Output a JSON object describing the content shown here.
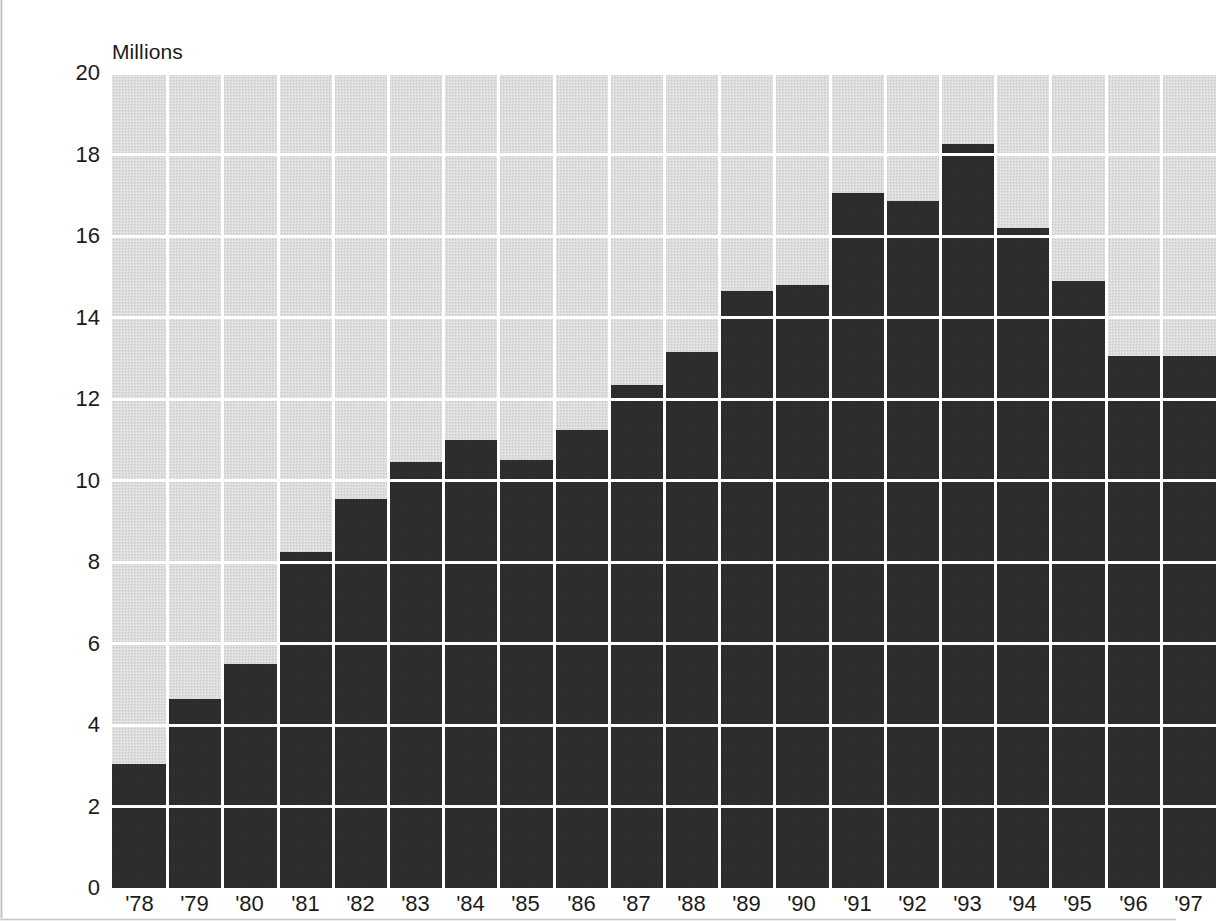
{
  "chart_data": {
    "type": "bar",
    "title": "",
    "subtitle": "",
    "units_label": "Millions",
    "xlabel": "",
    "ylabel": "Millions",
    "ylim": [
      0,
      20
    ],
    "ytick_values": [
      0,
      2,
      4,
      6,
      8,
      10,
      12,
      14,
      16,
      18,
      20
    ],
    "ytick_labels": [
      "0",
      "2",
      "4",
      "6",
      "8",
      "10",
      "12",
      "14",
      "16",
      "18",
      "20"
    ],
    "grid": true,
    "grid_color": "#ffffff",
    "legend": "none",
    "plot_background": "#dcdcdc",
    "bar_color": "#2b2b2b",
    "categories": [
      "'78",
      "'79",
      "'80",
      "'81",
      "'82",
      "'83",
      "'84",
      "'85",
      "'86",
      "'87",
      "'88",
      "'89",
      "'90",
      "'91",
      "'92",
      "'93",
      "'94",
      "'95",
      "'96",
      "'97"
    ],
    "values": [
      3.05,
      4.65,
      5.5,
      8.25,
      9.55,
      10.45,
      11.0,
      10.5,
      11.25,
      12.35,
      13.15,
      14.65,
      14.8,
      17.05,
      16.85,
      18.25,
      16.2,
      14.9,
      13.05,
      13.05
    ]
  },
  "ghost_marks": [
    {
      "text": "",
      "x": 905,
      "y": 90
    },
    {
      "text": "",
      "x": 905,
      "y": 160
    },
    {
      "text": "",
      "x": 880,
      "y": 215
    },
    {
      "text": "",
      "x": 905,
      "y": 255
    }
  ]
}
